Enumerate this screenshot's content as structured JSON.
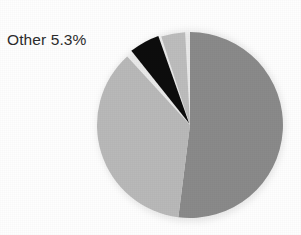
{
  "chart_data": {
    "type": "pie",
    "title": "",
    "xlabel": "",
    "ylabel": "",
    "legend_position": "none",
    "grid": false,
    "center": {
      "x": 190,
      "y": 125
    },
    "radius": 93,
    "start_angle_deg": -90,
    "direction": "clockwise",
    "background_color": "#fefefe",
    "categories": [
      "Segment 1",
      "Segment 2",
      "Other",
      "Segment 4"
    ],
    "values": [
      52.0,
      36.2,
      5.3,
      6.5
    ],
    "labels_shown": [
      "Other 5.3%"
    ],
    "slices": [
      {
        "name": "Segment 1",
        "value": 52.0,
        "color": "#8a8a8a",
        "start_deg": -90,
        "end_deg": 97.2,
        "exploded": false,
        "label": ""
      },
      {
        "name": "Segment 2",
        "value": 36.2,
        "color": "#b9b9b9",
        "start_deg": 97.2,
        "end_deg": 227.5,
        "exploded": false,
        "label": ""
      },
      {
        "name": "Other",
        "value": 5.3,
        "color": "#111111",
        "start_deg": 231.5,
        "end_deg": 250.6,
        "exploded": true,
        "label": "Other 5.3%"
      },
      {
        "name": "Segment 4",
        "value": 6.5,
        "color": "#bdbdbd",
        "start_deg": 252.0,
        "end_deg": -93.0,
        "exploded": false,
        "label": ""
      }
    ],
    "annotations": [
      {
        "name": "other-callout",
        "text": "Other 5.3%",
        "x": 7,
        "y": 31,
        "color": "#2b2b2b"
      }
    ]
  },
  "colors": {
    "slice_dark_gray": "#8a8a8a",
    "slice_light_gray": "#b9b9b9",
    "slice_black": "#111111",
    "slice_pale_gray": "#bdbdbd",
    "label_text": "#2b2b2b",
    "background": "#fefefe",
    "separator": "#ffffff"
  }
}
